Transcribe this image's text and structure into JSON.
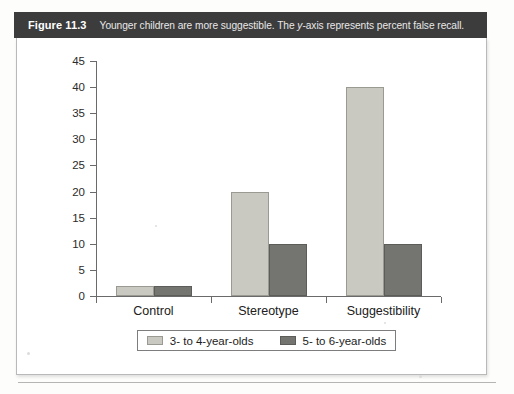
{
  "figure": {
    "number_label": "Figure 11.3",
    "caption_before_italic": "Younger children are more suggestible. The ",
    "caption_italic": "y",
    "caption_after_italic": "-axis represents percent false recall.",
    "caption_full": "Younger children are more suggestible. The y-axis represents percent false recall.",
    "header_color": "#3c3c3c"
  },
  "chart_data": {
    "type": "bar",
    "title": "",
    "xlabel": "",
    "ylabel": "",
    "categories": [
      "Control",
      "Stereotype",
      "Suggestibility"
    ],
    "series": [
      {
        "name": "3- to 4-year-olds",
        "values": [
          2,
          20,
          40
        ],
        "color": "#c9c9c2"
      },
      {
        "name": "5- to 6-year-olds",
        "values": [
          2,
          10,
          10
        ],
        "color": "#747470"
      }
    ],
    "ylim": [
      0,
      45
    ],
    "ytick_step": 5,
    "yticks": [
      0,
      5,
      10,
      15,
      20,
      25,
      30,
      35,
      40,
      45
    ],
    "ytick_labels": [
      "0",
      "5",
      "10",
      "15",
      "20",
      "25",
      "30",
      "35",
      "40",
      "45"
    ],
    "grid": false,
    "legend_position": "bottom"
  }
}
